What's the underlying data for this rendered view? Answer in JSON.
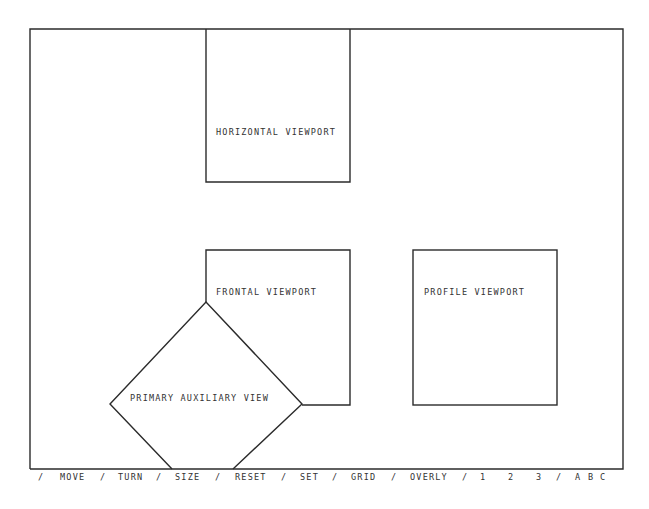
{
  "screen": {
    "viewports": {
      "horizontal": {
        "label": "HORIZONTAL VIEWPORT"
      },
      "frontal": {
        "label": "FRONTAL VIEWPORT"
      },
      "profile": {
        "label": "PROFILE VIEWPORT"
      },
      "auxiliary": {
        "label": "PRIMARY AUXILIARY VIEW"
      }
    }
  },
  "menu": {
    "items": [
      {
        "text": "/",
        "x": 0
      },
      {
        "text": "MOVE",
        "x": 22
      },
      {
        "text": "/",
        "x": 62
      },
      {
        "text": "TURN",
        "x": 80
      },
      {
        "text": "/",
        "x": 118
      },
      {
        "text": "SIZE",
        "x": 137
      },
      {
        "text": "/",
        "x": 177
      },
      {
        "text": "RESET",
        "x": 197
      },
      {
        "text": "/",
        "x": 243
      },
      {
        "text": "SET",
        "x": 262
      },
      {
        "text": "/",
        "x": 294
      },
      {
        "text": "GRID",
        "x": 313
      },
      {
        "text": "/",
        "x": 353
      },
      {
        "text": "OVERLY",
        "x": 372
      },
      {
        "text": "/",
        "x": 424
      },
      {
        "text": "1",
        "x": 442
      },
      {
        "text": "2",
        "x": 470
      },
      {
        "text": "3",
        "x": 498
      },
      {
        "text": "/",
        "x": 518
      },
      {
        "text": "A",
        "x": 537
      },
      {
        "text": "B",
        "x": 550
      },
      {
        "text": "C",
        "x": 562
      }
    ]
  }
}
